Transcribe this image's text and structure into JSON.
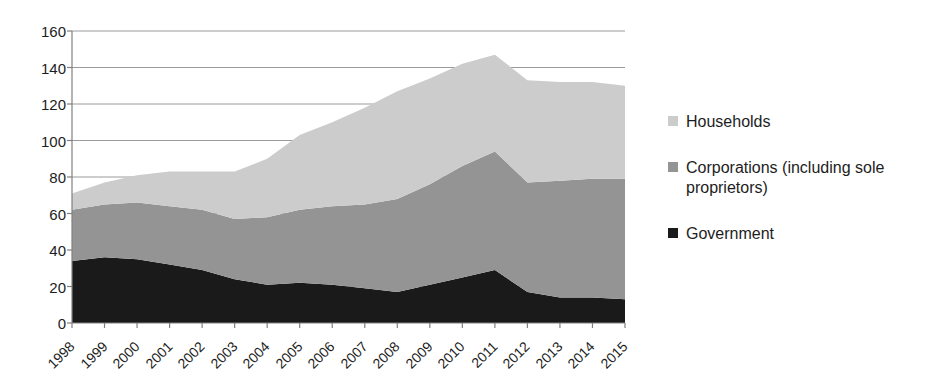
{
  "chart_data": {
    "type": "area",
    "stacked": true,
    "title": "",
    "xlabel": "",
    "ylabel": "",
    "categories": [
      "1998",
      "1999",
      "2000",
      "2001",
      "2002",
      "2003",
      "2004",
      "2005",
      "2006",
      "2007",
      "2008",
      "2009",
      "2010",
      "2011",
      "2012",
      "2013",
      "2014",
      "2015"
    ],
    "ylim": [
      0,
      160
    ],
    "ytick_values": [
      0,
      20,
      40,
      60,
      80,
      100,
      120,
      140,
      160
    ],
    "ytick_labels": [
      "0",
      "20",
      "40",
      "60",
      "80",
      "100",
      "120",
      "140",
      "160"
    ],
    "grid": "horizontal",
    "legend_position": "right",
    "series": [
      {
        "name": "Government",
        "color": "#1a1a1a",
        "values": [
          34,
          36,
          35,
          32,
          29,
          24,
          21,
          22,
          21,
          19,
          17,
          21,
          25,
          29,
          17,
          14,
          14,
          13
        ]
      },
      {
        "name": "Corporations (including sole proprietors)",
        "color": "#949494",
        "values": [
          28,
          29,
          31,
          32,
          33,
          33,
          37,
          40,
          43,
          46,
          51,
          55,
          61,
          65,
          60,
          64,
          65,
          66
        ]
      },
      {
        "name": "Households",
        "color": "#cccccc",
        "values": [
          9,
          12,
          15,
          19,
          21,
          26,
          32,
          41,
          46,
          53,
          59,
          58,
          56,
          53,
          56,
          54,
          53,
          51
        ]
      }
    ],
    "stack_order_bottom_to_top": [
      "Government",
      "Corporations (including sole proprietors)",
      "Households"
    ],
    "totals": [
      71,
      77,
      81,
      83,
      83,
      83,
      90,
      103,
      110,
      118,
      127,
      134,
      142,
      147,
      133,
      132,
      132,
      130
    ]
  },
  "legend": {
    "items": [
      {
        "label": "Households",
        "color": "#cccccc",
        "swatch_name": "legend-swatch-households"
      },
      {
        "label": "Corporations (including sole\nproprietors)",
        "color": "#949494",
        "swatch_name": "legend-swatch-corporations"
      },
      {
        "label": "Government",
        "color": "#1a1a1a",
        "swatch_name": "legend-swatch-government"
      }
    ]
  },
  "axes": {
    "y": {
      "ticks": [
        "160",
        "140",
        "120",
        "100",
        "80",
        "60",
        "40",
        "20",
        "0"
      ]
    },
    "x": {
      "ticks": [
        "1998",
        "1999",
        "2000",
        "2001",
        "2002",
        "2003",
        "2004",
        "2005",
        "2006",
        "2007",
        "2008",
        "2009",
        "2010",
        "2011",
        "2012",
        "2013",
        "2014",
        "2015"
      ]
    }
  },
  "colors": {
    "households": "#cccccc",
    "corporations": "#949494",
    "government": "#1a1a1a",
    "axis": "#808080",
    "grid": "#9a9a9a",
    "background": "#ffffff"
  }
}
